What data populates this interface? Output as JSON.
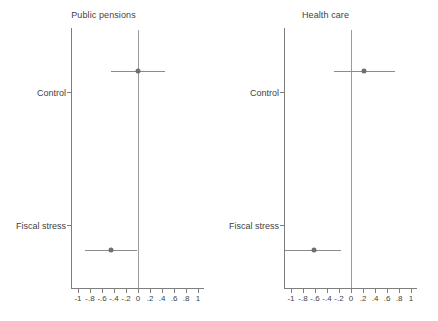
{
  "chart_data": {
    "type": "scatter",
    "title": "",
    "subtitle": "",
    "xlabel": "",
    "ylabel": "",
    "xlim": [
      -1.1,
      1.1
    ],
    "grid": false,
    "legend": null,
    "reference_line": 0,
    "xticks": [
      "-1",
      "-.8",
      "-.6",
      "-.4",
      "-.2",
      "0",
      ".2",
      ".4",
      ".6",
      ".8",
      "1"
    ],
    "xtick_values": [
      -1,
      -0.8,
      -0.6,
      -0.4,
      -0.2,
      0,
      0.2,
      0.4,
      0.6,
      0.8,
      1
    ],
    "categories": [
      "Control",
      "Fiscal stress"
    ],
    "panels": [
      {
        "title": "Public pensions",
        "points": [
          {
            "category": "Control",
            "estimate": 0.0,
            "ci_low": -0.45,
            "ci_high": 0.45
          },
          {
            "category": "Fiscal stress",
            "estimate": -0.45,
            "ci_low": -0.88,
            "ci_high": -0.02
          }
        ]
      },
      {
        "title": "Health care",
        "points": [
          {
            "category": "Control",
            "estimate": 0.22,
            "ci_low": -0.29,
            "ci_high": 0.73
          },
          {
            "category": "Fiscal stress",
            "estimate": -0.62,
            "ci_low": -1.1,
            "ci_high": -0.16
          }
        ]
      }
    ]
  },
  "style": {
    "point_color": "#6e6e78",
    "line_color": "#8b8b8b",
    "axis_color": "#7d7d7d",
    "zero_line_color": "#9a9a9a",
    "text_color": "#3f3f3f",
    "background": "#ffffff"
  }
}
